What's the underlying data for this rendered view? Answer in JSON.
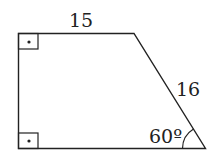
{
  "diagram": {
    "type": "right trapezoid",
    "labels": {
      "top_side": "15",
      "slant_side": "16",
      "angle": "60º"
    },
    "right_angle_markers": [
      "top-left",
      "bottom-left"
    ],
    "colors": {
      "stroke": "#222222",
      "background": "#ffffff"
    }
  }
}
